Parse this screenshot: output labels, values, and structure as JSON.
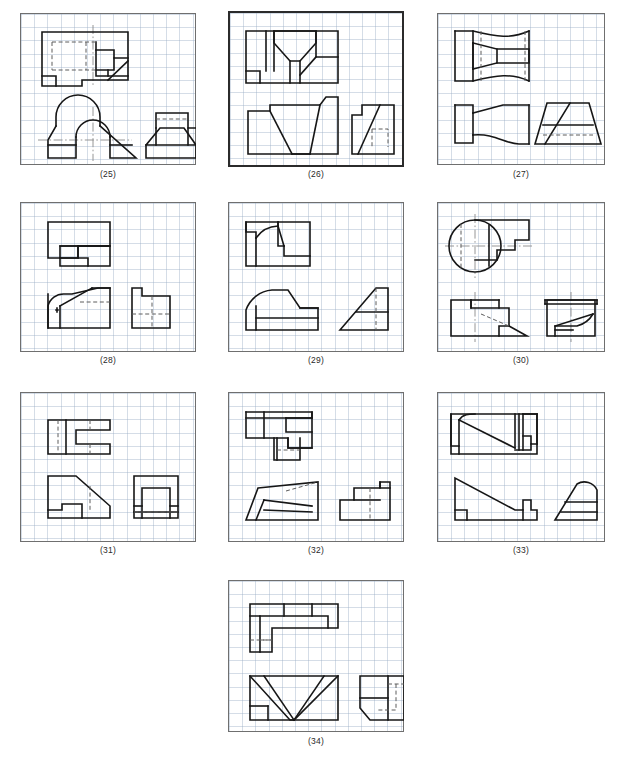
{
  "sheet": {
    "title": "Multiview orthographic projection exercises",
    "background_color": "#ffffff",
    "grid_color": "#96aac3",
    "line_color": "#161616",
    "hidden_line_color": "#5d5d5d",
    "center_line_color": "#8a8a8a",
    "columns": 3,
    "rows": 4
  },
  "panels": [
    {
      "id": "p25",
      "label": "(25)",
      "emphasis": false,
      "x": 20,
      "y": 13,
      "w": 176,
      "h": 152,
      "views": [
        "top",
        "front",
        "right-side"
      ],
      "description": "Stepped block, top view with hidden slot; front view with semicircular arch and inclined cut; right side view with raised boss"
    },
    {
      "id": "p26",
      "label": "(26)",
      "emphasis": true,
      "x": 228,
      "y": 11,
      "w": 176,
      "h": 156,
      "views": [
        "top",
        "front",
        "right-side"
      ],
      "description": "V-notched block; front view shows trapezoidal V groove; side view with inclined face and hidden step"
    },
    {
      "id": "p27",
      "label": "(27)",
      "emphasis": false,
      "x": 437,
      "y": 13,
      "w": 168,
      "h": 152,
      "views": [
        "top",
        "front",
        "right-side"
      ],
      "description": "Waisted spool with concave flanks; side view is a trapezoid with horizontal band and hidden line"
    },
    {
      "id": "p28",
      "label": "(28)",
      "emphasis": false,
      "x": 20,
      "y": 202,
      "w": 176,
      "h": 150,
      "views": [
        "top",
        "front",
        "right-side"
      ],
      "description": "Block with chamfered corner and rounded corner; hidden lines show internal step"
    },
    {
      "id": "p29",
      "label": "(29)",
      "emphasis": false,
      "x": 228,
      "y": 202,
      "w": 176,
      "h": 150,
      "views": [
        "top",
        "front",
        "right-side"
      ],
      "description": "Block with quarter-round fillet and notch; side view triangular with hidden line"
    },
    {
      "id": "p30",
      "label": "(30)",
      "emphasis": false,
      "x": 437,
      "y": 202,
      "w": 168,
      "h": 150,
      "views": [
        "top",
        "front",
        "right-side"
      ],
      "description": "Cylindrical boss on stepped block; top view has full circle with centre lines; front view with inclined hidden line and wedge"
    },
    {
      "id": "p31",
      "label": "(31)",
      "emphasis": false,
      "x": 20,
      "y": 392,
      "w": 176,
      "h": 150,
      "views": [
        "top",
        "front",
        "right-side"
      ],
      "description": "Forked (slotted) block; front view with inclined face and bottom notch; side view with internal rectangle"
    },
    {
      "id": "p32",
      "label": "(32)",
      "emphasis": false,
      "x": 228,
      "y": 392,
      "w": 176,
      "h": 150,
      "views": [
        "top",
        "front",
        "right-side"
      ],
      "description": "Stepped block with oblique faces; front view with two inclined edges and hidden line"
    },
    {
      "id": "p33",
      "label": "(33)",
      "emphasis": false,
      "x": 437,
      "y": 392,
      "w": 168,
      "h": 150,
      "views": [
        "top",
        "front",
        "right-side"
      ],
      "description": "Ramped block with rib; front view with long incline and central rib; side view with rounded top and slanted base"
    },
    {
      "id": "p34",
      "label": "(34)",
      "emphasis": false,
      "x": 228,
      "y": 580,
      "w": 176,
      "h": 152,
      "views": [
        "top",
        "front",
        "right-side"
      ],
      "description": "L-shaped block; front view with large V notch; side view with chamfered lower-left corner and hidden slot"
    }
  ]
}
